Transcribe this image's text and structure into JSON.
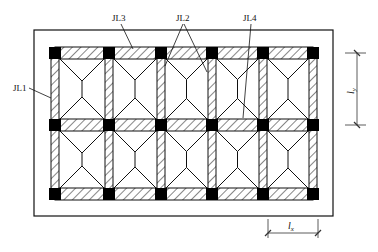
{
  "diagram": {
    "type": "foundation-plan",
    "outer_border": {
      "x": 34,
      "y": 30,
      "w": 299,
      "h": 186
    },
    "grid": {
      "column_x": [
        55,
        109,
        161,
        212,
        263,
        313
      ],
      "row_y": [
        53,
        125,
        194
      ],
      "column_size": 12,
      "beam_width": 10
    },
    "labels": [
      {
        "id": "JL1",
        "text": "JL1",
        "x": 13,
        "y": 91
      },
      {
        "id": "JL3",
        "text": "JL3",
        "x": 113,
        "y": 21
      },
      {
        "id": "JL2",
        "text": "JL2",
        "x": 177,
        "y": 21
      },
      {
        "id": "JL4",
        "text": "JL4",
        "x": 244,
        "y": 21
      }
    ],
    "dimensions": [
      {
        "id": "ly",
        "text": "l",
        "subscript": "y",
        "orientation": "vertical"
      },
      {
        "id": "lx",
        "text": "l",
        "subscript": "x",
        "orientation": "horizontal"
      }
    ],
    "colors": {
      "line": "#111111",
      "hatch": "#222222",
      "column_fill": "#000000",
      "background": "#ffffff"
    }
  }
}
